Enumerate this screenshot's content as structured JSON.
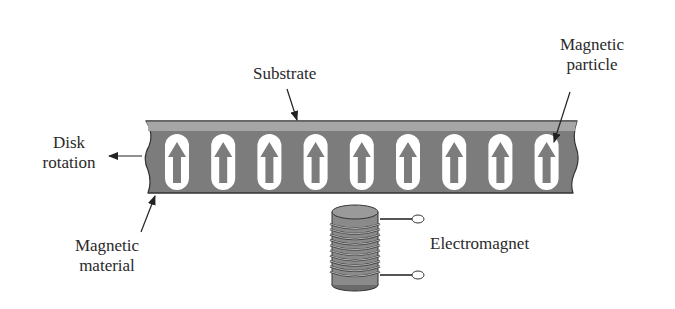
{
  "labels": {
    "substrate": "Substrate",
    "magnetic_particle_line1": "Magnetic",
    "magnetic_particle_line2": "particle",
    "disk_rotation_line1": "Disk",
    "disk_rotation_line2": "rotation",
    "magnetic_material_line1": "Magnetic",
    "magnetic_material_line2": "material",
    "electromagnet": "Electromagnet"
  },
  "strip": {
    "particle_count": 9,
    "particle_direction": "up"
  },
  "icons": {
    "particle": "up-arrow-icon",
    "coil": "electromagnet-coil-icon"
  },
  "colors": {
    "substrate": "#a6a6a6",
    "magnetic_material": "#7c7c7c",
    "particle_capsule": "#ffffff",
    "arrow": "#7c7c7c",
    "outline": "#333333",
    "text": "#2a2a2a"
  }
}
